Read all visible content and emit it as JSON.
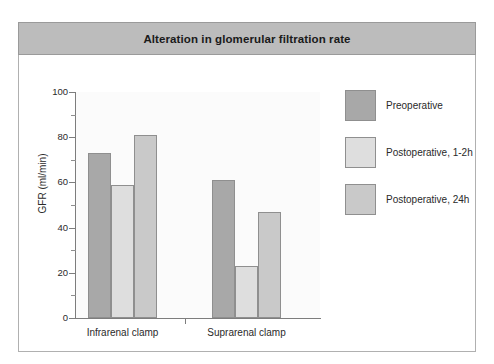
{
  "figure": {
    "title": "Alteration in glomerular filtration rate",
    "title_band_color": "#bcbcbc",
    "frame_border_color": "#b0b0b0",
    "plot_background": "#fbfbfb"
  },
  "chart_data": {
    "type": "bar",
    "title": "Alteration in glomerular filtration rate",
    "xlabel": "",
    "ylabel": "GFR (ml/min)",
    "categories": [
      "Infrarenal clamp",
      "Suprarenal clamp"
    ],
    "series": [
      {
        "name": "Preoperative",
        "color": "#a8a8a8",
        "values": [
          73,
          61
        ]
      },
      {
        "name": "Postoperative, 1-2h",
        "color": "#dedede",
        "values": [
          59,
          23
        ]
      },
      {
        "name": "Postoperative, 24h",
        "color": "#c9c9c9",
        "values": [
          81,
          47
        ]
      }
    ],
    "ylim": [
      0,
      100
    ],
    "ytick_major": [
      0,
      20,
      40,
      60,
      80,
      100
    ],
    "ytick_minor": [
      10,
      30,
      50,
      70,
      90
    ],
    "grid": false,
    "legend_position": "right"
  },
  "axis": {
    "y_title": "GFR (ml/min)",
    "y_labels": [
      "100",
      "80",
      "60",
      "40",
      "20",
      "0"
    ],
    "x_labels": [
      "Infrarenal clamp",
      "Suprarenal clamp"
    ]
  },
  "legend": {
    "items": [
      {
        "label": "Preoperative",
        "color": "#a8a8a8"
      },
      {
        "label": "Postoperative, 1-2h",
        "color": "#dedede"
      },
      {
        "label": "Postoperative, 24h",
        "color": "#c9c9c9"
      }
    ]
  }
}
